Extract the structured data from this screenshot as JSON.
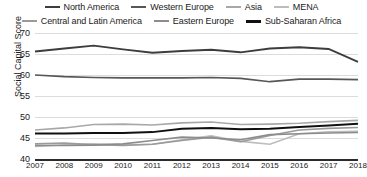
{
  "chart_data": {
    "type": "line",
    "title": "",
    "xlabel": "",
    "ylabel": "Social Capital Score",
    "ylim": [
      40,
      70
    ],
    "yticks": [
      40,
      45,
      50,
      55,
      60,
      65,
      70
    ],
    "grid": true,
    "legend_position": "top",
    "x": [
      "2007",
      "2008",
      "2009",
      "2010",
      "2011",
      "2012",
      "2013",
      "2014",
      "2015",
      "2016",
      "2017",
      "2018"
    ],
    "categories": [
      "2007",
      "2008",
      "2009",
      "2010",
      "2011",
      "2012",
      "2013",
      "2014",
      "2015",
      "2016",
      "2017",
      "2018"
    ],
    "series": [
      {
        "name": "North America",
        "color": "#3d3d3d",
        "width": 1.9,
        "values": [
          65.6,
          66.3,
          67.0,
          66.1,
          65.3,
          65.7,
          66.0,
          65.4,
          66.3,
          66.6,
          66.2,
          63.1
        ]
      },
      {
        "name": "Western Europe",
        "color": "#575757",
        "width": 1.7,
        "values": [
          60.0,
          59.6,
          59.4,
          59.3,
          59.3,
          59.3,
          59.4,
          59.2,
          58.4,
          59.0,
          59.0,
          58.9
        ]
      },
      {
        "name": "Asia",
        "color": "#a8a8a8",
        "width": 1.6,
        "values": [
          46.9,
          47.4,
          48.2,
          48.3,
          48.1,
          48.6,
          48.8,
          48.2,
          48.3,
          48.5,
          48.9,
          49.2
        ]
      },
      {
        "name": "MENA",
        "color": "#bcbcbc",
        "width": 1.6,
        "values": [
          43.0,
          43.4,
          43.6,
          43.4,
          43.5,
          44.6,
          45.5,
          44.2,
          43.5,
          46.0,
          46.5,
          46.6
        ]
      },
      {
        "name": "Central and Latin America",
        "color": "#9a9a9a",
        "width": 1.6,
        "values": [
          43.6,
          43.8,
          43.4,
          43.2,
          43.5,
          44.4,
          45.2,
          44.1,
          45.6,
          46.9,
          47.3,
          47.5
        ]
      },
      {
        "name": "Eastern Europe",
        "color": "#8c8c8c",
        "width": 1.6,
        "values": [
          43.2,
          43.2,
          43.3,
          43.6,
          44.4,
          45.2,
          45.0,
          44.6,
          45.8,
          46.0,
          46.2,
          46.3
        ]
      },
      {
        "name": "Sub-Saharan Africa",
        "color": "#101010",
        "width": 2.0,
        "values": [
          46.1,
          46.1,
          46.2,
          46.2,
          46.4,
          47.2,
          47.4,
          47.1,
          47.2,
          47.6,
          48.0,
          48.4
        ]
      }
    ]
  },
  "legend": {
    "row1": [
      {
        "label": "North America",
        "color": "#3d3d3d",
        "width": 2
      },
      {
        "label": "Western Europe",
        "color": "#575757",
        "width": 2
      },
      {
        "label": "Asia",
        "color": "#a8a8a8",
        "width": 2
      },
      {
        "label": "MENA",
        "color": "#bcbcbc",
        "width": 2
      }
    ],
    "row2": [
      {
        "label": "Central and Latin America",
        "color": "#9a9a9a",
        "width": 2
      },
      {
        "label": "Eastern Europe",
        "color": "#8c8c8c",
        "width": 2
      },
      {
        "label": "Sub-Saharan Africa",
        "color": "#101010",
        "width": 3
      }
    ]
  },
  "axes": {
    "y_title": "Social Capital Score",
    "y_labels": [
      "70",
      "65",
      "60",
      "55",
      "50",
      "45",
      "40"
    ],
    "x_labels": [
      "2007",
      "2008",
      "2009",
      "2010",
      "2011",
      "2012",
      "2013",
      "2014",
      "2015",
      "2016",
      "2017",
      "2018"
    ]
  }
}
